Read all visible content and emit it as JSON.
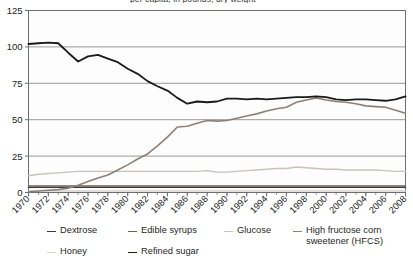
{
  "title_partial": "per capita, in pounds, dry weight",
  "legend": {
    "items": [
      {
        "label": "Dextrose",
        "color": "#3b3b3b",
        "name": "legend-item-dextrose"
      },
      {
        "label": "Edible syrups",
        "color": "#6b6258",
        "name": "legend-item-edible-syrups"
      },
      {
        "label": "Glucose",
        "color": "#c8c3bb",
        "name": "legend-item-glucose"
      },
      {
        "label": "High fructose corn\nsweetener (HFCS)",
        "color": "#8a8178",
        "name": "legend-item-hfcs"
      },
      {
        "label": "Honey",
        "color": "#d8d4cd",
        "name": "legend-item-honey"
      },
      {
        "label": "Refined sugar",
        "color": "#1a1a1a",
        "name": "legend-item-refined-sugar"
      }
    ]
  },
  "chart_data": {
    "type": "line",
    "title": "per capita, in pounds, dry weight",
    "xlabel": "",
    "ylabel": "",
    "xlim": [
      1970,
      2008
    ],
    "ylim": [
      0,
      125
    ],
    "yticks": [
      0,
      25,
      50,
      75,
      100,
      125
    ],
    "grid": true,
    "legend_position": "bottom",
    "x": [
      1970,
      1971,
      1972,
      1973,
      1974,
      1975,
      1976,
      1977,
      1978,
      1979,
      1980,
      1981,
      1982,
      1983,
      1984,
      1985,
      1986,
      1987,
      1988,
      1989,
      1990,
      1991,
      1992,
      1993,
      1994,
      1995,
      1996,
      1997,
      1998,
      1999,
      2000,
      2001,
      2002,
      2003,
      2004,
      2005,
      2006,
      2007,
      2008
    ],
    "xticks": [
      1970,
      1972,
      1974,
      1976,
      1978,
      1980,
      1982,
      1984,
      1986,
      1988,
      1990,
      1992,
      1994,
      1996,
      1998,
      2000,
      2002,
      2004,
      2006,
      2008
    ],
    "series": [
      {
        "name": "Refined sugar",
        "color": "#1a1a1a",
        "width": 1.8,
        "values": [
          102,
          102.5,
          103,
          102.5,
          96,
          90,
          93.5,
          94.5,
          92,
          89.5,
          85,
          81.5,
          76.5,
          73,
          70,
          65,
          61,
          62.5,
          62,
          62.5,
          64.5,
          64.5,
          64,
          64.5,
          64,
          64.5,
          65,
          65.5,
          65.5,
          66,
          65.5,
          64,
          63.5,
          64,
          64,
          63.5,
          63,
          64,
          66
        ]
      },
      {
        "name": "High fructose corn sweetener (HFCS)",
        "color": "#8a8178",
        "width": 1.6,
        "values": [
          0.5,
          1,
          1.5,
          2,
          3,
          5,
          7.5,
          10,
          12,
          15.5,
          19,
          23,
          26.5,
          32,
          38,
          45,
          45.5,
          47.5,
          49.5,
          49,
          49.5,
          51,
          52.5,
          54,
          56,
          57.5,
          58.5,
          62,
          63.5,
          65,
          63.5,
          62.5,
          62,
          61,
          59.5,
          59,
          58.5,
          56.5,
          54.5
        ]
      },
      {
        "name": "Glucose",
        "color": "#c8c3bb",
        "width": 1.4,
        "values": [
          11.5,
          12.5,
          13,
          13.5,
          14,
          14.5,
          14.5,
          14.5,
          14.5,
          14.5,
          14.5,
          14.5,
          14.5,
          14.5,
          14.5,
          14.5,
          14.5,
          14.5,
          15,
          14,
          14,
          14.5,
          15,
          15.5,
          16,
          16.5,
          16.5,
          17.5,
          17,
          16.5,
          16,
          16,
          15.5,
          15.5,
          15.5,
          15.5,
          15,
          14.5,
          14.5
        ]
      },
      {
        "name": "Edible syrups",
        "color": "#6b6258",
        "width": 1.4,
        "values": [
          4.5,
          4.5,
          4.5,
          4.5,
          4.5,
          4.5,
          4.5,
          4.5,
          4.5,
          4.5,
          4.5,
          4.5,
          4.5,
          4.5,
          4.5,
          4.5,
          4.5,
          4.5,
          4.5,
          4.5,
          4.5,
          4.5,
          4.5,
          4.5,
          4.5,
          4.5,
          4.5,
          4.5,
          4.5,
          4.5,
          4.5,
          4.5,
          4.5,
          4.5,
          4.5,
          4.5,
          4.5,
          4.5,
          4.5
        ]
      },
      {
        "name": "Dextrose",
        "color": "#3b3b3b",
        "width": 1.4,
        "values": [
          3.5,
          3.5,
          3.5,
          3.5,
          3.5,
          3.5,
          3.5,
          3.5,
          3.5,
          3.5,
          3.5,
          3.5,
          3.5,
          3.5,
          3.5,
          3.5,
          3.5,
          3.5,
          3.5,
          3.5,
          3.5,
          3.5,
          3.5,
          3.5,
          3.5,
          3.5,
          3.5,
          3.5,
          3.5,
          3.5,
          3.5,
          3.5,
          3.5,
          3.5,
          3.5,
          3.5,
          3.5,
          3.5,
          3.5
        ]
      },
      {
        "name": "Honey",
        "color": "#d8d4cd",
        "width": 1.4,
        "values": [
          1,
          1,
          1,
          1,
          1,
          1,
          1,
          1,
          1,
          1,
          1,
          1,
          1,
          1,
          1,
          1,
          1,
          1,
          1,
          1,
          1,
          1,
          1,
          1,
          1,
          1,
          1,
          1,
          1,
          1,
          1,
          1,
          1,
          1,
          1,
          1,
          1,
          1,
          1
        ]
      }
    ]
  },
  "axis": {
    "y_tick_labels": [
      "125",
      "100",
      "75",
      "50",
      "25",
      "0"
    ],
    "x_tick_labels": [
      "1970",
      "1972",
      "1974",
      "1976",
      "1978",
      "1980",
      "1982",
      "1984",
      "1986",
      "1988",
      "1990",
      "1992",
      "1994",
      "1996",
      "1998",
      "2000",
      "2002",
      "2004",
      "2006",
      "2008"
    ]
  },
  "colors": {
    "plot_background": "#fdfdfd",
    "grid": "#8d8d8d",
    "frame": "#6d6d6d",
    "text": "#1a1a1a"
  }
}
